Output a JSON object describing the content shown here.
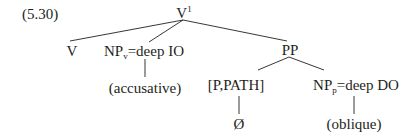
{
  "example": {
    "number": "(5.30)"
  },
  "tree": {
    "root": {
      "label": "V",
      "superscript": "1"
    },
    "v_node": {
      "label": "V"
    },
    "np_v": {
      "label": "NP",
      "subscript": "v",
      "suffix": "=deep IO",
      "child": "(accusative)"
    },
    "pp": {
      "label": "PP"
    },
    "p_path": {
      "label": "[P,PATH]",
      "child": "Ø"
    },
    "np_p": {
      "label": "NP",
      "subscript": "p",
      "suffix": "=deep DO",
      "child": "(oblique)"
    }
  },
  "colors": {
    "ink": "#231f20",
    "background": "#ffffff"
  }
}
